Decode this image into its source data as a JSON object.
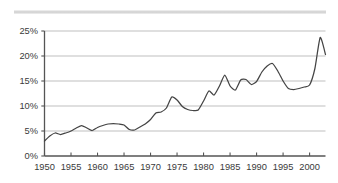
{
  "chart_data": {
    "type": "line",
    "title": "",
    "subtitle": "",
    "xlabel": "",
    "ylabel": "",
    "xlim": [
      1950,
      2003
    ],
    "ylim": [
      0,
      25
    ],
    "grid": true,
    "grid_axis": "y",
    "legend": null,
    "legend_position": "none",
    "series_color": "#444444",
    "gridline_color": "#b4b4b4",
    "axis_color": "#555555",
    "background_color": "#ffffff",
    "y_ticks": [
      0,
      5,
      10,
      15,
      20,
      25
    ],
    "y_tick_labels": [
      "0%",
      "5%",
      "10%",
      "15%",
      "20%",
      "25%"
    ],
    "x_ticks": [
      1950,
      1955,
      1960,
      1965,
      1970,
      1975,
      1980,
      1985,
      1990,
      1995,
      2000
    ],
    "x_tick_labels": [
      "1950",
      "1955",
      "1960",
      "1965",
      "1970",
      "1975",
      "1980",
      "1985",
      "1990",
      "1995",
      "2000"
    ],
    "x": [
      1950,
      1951,
      1952,
      1953,
      1954,
      1955,
      1956,
      1957,
      1958,
      1959,
      1960,
      1961,
      1962,
      1963,
      1964,
      1965,
      1966,
      1967,
      1968,
      1969,
      1970,
      1971,
      1972,
      1973,
      1974,
      1975,
      1976,
      1977,
      1978,
      1979,
      1980,
      1981,
      1982,
      1983,
      1984,
      1985,
      1986,
      1987,
      1988,
      1989,
      1990,
      1991,
      1992,
      1993,
      1994,
      1995,
      1996,
      1997,
      1998,
      1999,
      2000,
      2001,
      2002,
      2003
    ],
    "values": [
      3.0,
      4.0,
      4.6,
      4.3,
      4.6,
      5.0,
      5.6,
      6.1,
      5.6,
      5.1,
      5.7,
      6.1,
      6.4,
      6.5,
      6.4,
      6.2,
      5.3,
      5.2,
      5.8,
      6.4,
      7.3,
      8.6,
      8.8,
      9.6,
      11.8,
      11.2,
      9.9,
      9.3,
      9.1,
      9.2,
      11.0,
      13.0,
      12.2,
      14.0,
      16.2,
      14.0,
      13.2,
      15.2,
      15.3,
      14.3,
      14.9,
      16.8,
      18.0,
      18.5,
      17.0,
      15.0,
      13.5,
      13.3,
      13.5,
      13.8,
      14.2,
      17.5,
      23.7,
      20.3
    ],
    "peaks": [
      {
        "year": 1974,
        "value": 11.8
      },
      {
        "year": 1984,
        "value": 16.2
      },
      {
        "year": 1993,
        "value": 18.5
      },
      {
        "year": 2002,
        "value": 23.7
      }
    ],
    "troughs": [
      {
        "year": 1950,
        "value": 3.0
      },
      {
        "year": 1966,
        "value": 5.3
      },
      {
        "year": 1978,
        "value": 9.1
      },
      {
        "year": 1997,
        "value": 13.3
      }
    ],
    "end_value": 20.3
  }
}
